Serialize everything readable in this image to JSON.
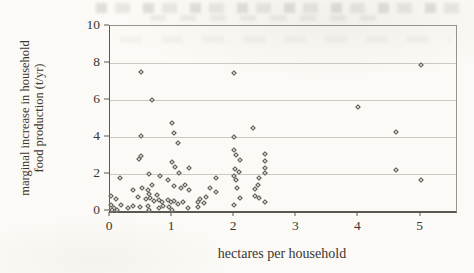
{
  "figure": {
    "bg_color": "#fbfaf6",
    "text_color": "#3a3631",
    "axis_color": "#5c5952",
    "frame_color": "#97948e",
    "grid_color": "#cbc9c4",
    "marker_color": "#5a5752",
    "marker_fill": "#dedbd4"
  },
  "chart_data": {
    "type": "scatter",
    "title": "",
    "xlabel": "hectares per household",
    "ylabel": "marginal increase in household food production (t/yr)",
    "ylabel_lines": [
      "marginal increase in household",
      "food production (t/yr)"
    ],
    "xlim": [
      0,
      5.57
    ],
    "ylim": [
      0,
      10
    ],
    "xticks": [
      0,
      1,
      2,
      3,
      4,
      5
    ],
    "yticks": [
      0,
      2,
      4,
      6,
      8,
      10
    ],
    "grid": "horizontal-only",
    "legend": false,
    "marker": "open-diamond",
    "points": [
      [
        0.5,
        7.5
      ],
      [
        2.0,
        7.48
      ],
      [
        5.0,
        7.9
      ],
      [
        0.68,
        6.0
      ],
      [
        4.0,
        5.6
      ],
      [
        1.0,
        4.75
      ],
      [
        2.3,
        4.5
      ],
      [
        4.6,
        4.25
      ],
      [
        1.03,
        4.2
      ],
      [
        0.5,
        4.05
      ],
      [
        2.0,
        4.0
      ],
      [
        1.1,
        3.7
      ],
      [
        2.0,
        3.3
      ],
      [
        2.5,
        3.1
      ],
      [
        2.03,
        3.05
      ],
      [
        0.5,
        3.0
      ],
      [
        0.47,
        2.8
      ],
      [
        2.1,
        2.75
      ],
      [
        2.5,
        2.7
      ],
      [
        1.0,
        2.65
      ],
      [
        1.05,
        2.4
      ],
      [
        1.27,
        2.35
      ],
      [
        2.5,
        2.33
      ],
      [
        2.01,
        2.25
      ],
      [
        4.6,
        2.2
      ],
      [
        2.08,
        2.1
      ],
      [
        2.5,
        2.05
      ],
      [
        1.11,
        2.05
      ],
      [
        0.63,
        2.0
      ],
      [
        0.81,
        1.9
      ],
      [
        2.0,
        1.9
      ],
      [
        0.16,
        1.8
      ],
      [
        1.7,
        1.78
      ],
      [
        2.4,
        1.78
      ],
      [
        5.0,
        1.7
      ],
      [
        2.03,
        1.68
      ],
      [
        0.94,
        1.65
      ],
      [
        0.68,
        1.42
      ],
      [
        2.38,
        1.4
      ],
      [
        1.21,
        1.38
      ],
      [
        1.03,
        1.34
      ],
      [
        0.52,
        1.25
      ],
      [
        1.14,
        1.24
      ],
      [
        1.61,
        1.24
      ],
      [
        2.05,
        1.24
      ],
      [
        2.33,
        1.2
      ],
      [
        0.37,
        1.11
      ],
      [
        0.61,
        1.11
      ],
      [
        1.27,
        1.11
      ],
      [
        1.7,
        1.05
      ],
      [
        0.63,
        0.93
      ],
      [
        0.75,
        0.87
      ],
      [
        2.33,
        0.83
      ],
      [
        0.02,
        0.8
      ],
      [
        1.54,
        0.78
      ],
      [
        0.45,
        0.75
      ],
      [
        2.1,
        0.7
      ],
      [
        2.4,
        0.7
      ],
      [
        0.65,
        0.69
      ],
      [
        0.1,
        0.65
      ],
      [
        0.58,
        0.65
      ],
      [
        1.45,
        0.65
      ],
      [
        0.79,
        0.62
      ],
      [
        0.94,
        0.62
      ],
      [
        0.71,
        0.56
      ],
      [
        1.03,
        0.56
      ],
      [
        1.17,
        0.51
      ],
      [
        1.41,
        0.5
      ],
      [
        2.5,
        0.5
      ],
      [
        0.84,
        0.47
      ],
      [
        0.98,
        0.47
      ],
      [
        1.51,
        0.44
      ],
      [
        1.1,
        0.38
      ],
      [
        0.02,
        0.3
      ],
      [
        0.18,
        0.3
      ],
      [
        2.0,
        0.3
      ],
      [
        0.37,
        0.29
      ],
      [
        0.61,
        0.29
      ],
      [
        0.85,
        0.26
      ],
      [
        0.49,
        0.2
      ],
      [
        0.95,
        0.2
      ],
      [
        1.42,
        0.2
      ],
      [
        1.26,
        0.18
      ],
      [
        0.07,
        0.15
      ],
      [
        0.29,
        0.15
      ],
      [
        0.79,
        0.15
      ],
      [
        0.04,
        0.05
      ],
      [
        0.12,
        0.05
      ],
      [
        0.63,
        0.07
      ],
      [
        1.0,
        0.07
      ]
    ]
  }
}
